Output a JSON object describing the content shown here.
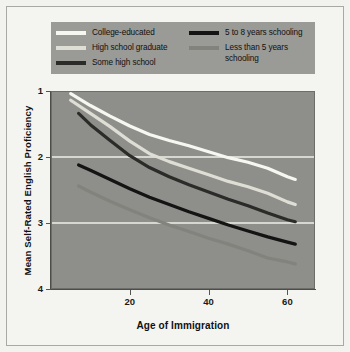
{
  "chart_data": {
    "type": "line",
    "title": "",
    "xlabel": "Age of Immigration",
    "ylabel": "Mean Self-Rated English Proficiency",
    "xlim": [
      0,
      67
    ],
    "ylim": [
      1,
      4
    ],
    "xticks": [
      20,
      40,
      60
    ],
    "yticks": [
      1,
      2,
      3,
      4
    ],
    "grid": "horizontal",
    "legend_position": "top",
    "plot_background": "#8e8e8a",
    "legend_background": "#9a9a96",
    "gridline_color": "#efefe9",
    "series": [
      {
        "name": "College-educated",
        "color": "#f7f7f2",
        "x": [
          5,
          10,
          15,
          20,
          25,
          30,
          35,
          40,
          45,
          50,
          55,
          60,
          62
        ],
        "values": [
          3.96,
          3.78,
          3.62,
          3.47,
          3.34,
          3.25,
          3.17,
          3.08,
          2.99,
          2.92,
          2.83,
          2.7,
          2.66
        ]
      },
      {
        "name": "High school graduate",
        "color": "#dedeD5",
        "x": [
          5,
          10,
          15,
          20,
          25,
          30,
          35,
          40,
          45,
          50,
          55,
          60,
          62
        ],
        "values": [
          3.86,
          3.66,
          3.46,
          3.24,
          3.05,
          2.93,
          2.83,
          2.73,
          2.63,
          2.55,
          2.45,
          2.32,
          2.28
        ]
      },
      {
        "name": "Some high school",
        "color": "#2b2b29",
        "x": [
          7,
          10,
          15,
          20,
          25,
          30,
          35,
          40,
          45,
          50,
          55,
          60,
          62
        ],
        "values": [
          3.66,
          3.49,
          3.25,
          3.02,
          2.84,
          2.7,
          2.58,
          2.47,
          2.36,
          2.26,
          2.15,
          2.05,
          2.02
        ]
      },
      {
        "name": "5 to 8 years schooling",
        "color": "#141414",
        "x": [
          7,
          10,
          15,
          20,
          25,
          30,
          35,
          40,
          45,
          50,
          55,
          60,
          62
        ],
        "values": [
          2.88,
          2.8,
          2.66,
          2.52,
          2.39,
          2.28,
          2.17,
          2.07,
          1.97,
          1.88,
          1.79,
          1.71,
          1.68
        ]
      },
      {
        "name": "Less than 5 years schooling",
        "color": "#83837e",
        "x": [
          7,
          10,
          15,
          20,
          25,
          30,
          35,
          40,
          45,
          50,
          55,
          60,
          62
        ],
        "values": [
          2.56,
          2.47,
          2.33,
          2.2,
          2.08,
          1.97,
          1.87,
          1.77,
          1.68,
          1.58,
          1.47,
          1.41,
          1.38
        ]
      }
    ]
  },
  "legend": {
    "left_column": [
      {
        "label": "College-educated",
        "color": "#f7f7f2"
      },
      {
        "label": "High school graduate",
        "color": "#dedeD5"
      },
      {
        "label": "Some high school",
        "color": "#2b2b29"
      }
    ],
    "right_column": [
      {
        "label": "5 to 8 years schooling",
        "color": "#141414"
      },
      {
        "label": "Less than 5 years\nschooling",
        "color": "#83837e"
      }
    ]
  },
  "axes": {
    "y_tick_labels": [
      "4",
      "3",
      "2",
      "1"
    ],
    "x_tick_labels": [
      "20",
      "40",
      "60"
    ],
    "x_title": "Age of Immigration",
    "y_title": "Mean Self-Rated English Proficiency"
  }
}
